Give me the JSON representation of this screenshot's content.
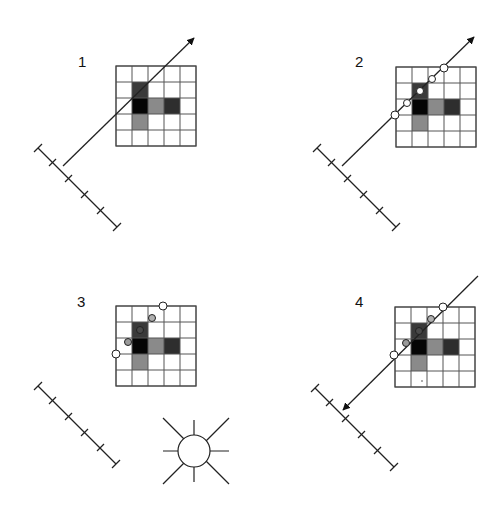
{
  "figure": {
    "panels": [
      {
        "label": "1",
        "description": "Ray cast from detector toward image grid"
      },
      {
        "label": "2",
        "description": "Sample points along the ray through the grid"
      },
      {
        "label": "3",
        "description": "Sample values shaded by pixel intensity, illuminated by source"
      },
      {
        "label": "4",
        "description": "Accumulated samples projected back to detector"
      }
    ],
    "grid": {
      "rows": 5,
      "cols": 5,
      "cells": [
        [
          0,
          0,
          0,
          0,
          0
        ],
        [
          0,
          3,
          0,
          0,
          0
        ],
        [
          0,
          4,
          2,
          3.5,
          0
        ],
        [
          0,
          2,
          0,
          0,
          0
        ],
        [
          0,
          0,
          0,
          0,
          0
        ]
      ]
    },
    "colors": {
      "black": "#050505",
      "dark": "#3a3a3a",
      "darkgray": "#4a4a4a",
      "mid": "#8a8a8a",
      "line": "#222222",
      "grid_line": "#444444",
      "sample_white": "#ffffff",
      "sample_gray": "#9a9a9a"
    },
    "detector_ticks": 6,
    "icons": [
      "arrow-icon",
      "sun-icon",
      "sample-point-icon",
      "detector-ruler-icon"
    ]
  }
}
